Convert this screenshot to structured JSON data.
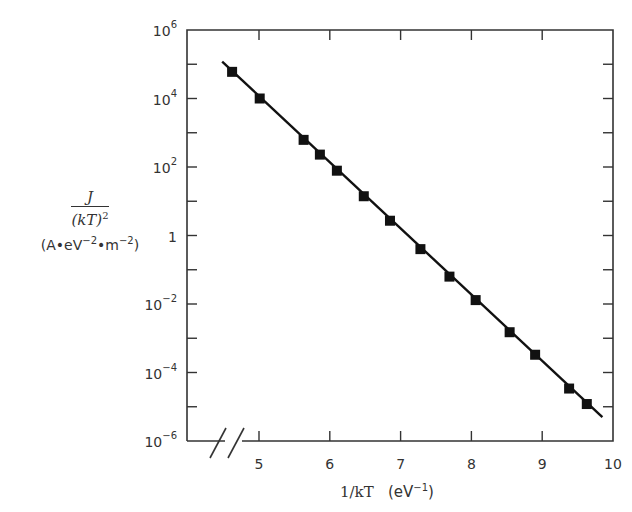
{
  "chart_data": {
    "type": "scatter",
    "title": "",
    "xlabel": "1/kT (eV^-1)",
    "ylabel": "J/(kT)^2 (A·eV^-2·m^-2)",
    "x_scale": "linear",
    "y_scale": "log",
    "xlim": [
      4.0,
      10
    ],
    "ylim": [
      1e-06,
      1000000.0
    ],
    "x_axis_break": true,
    "x_ticks": [
      5,
      6,
      7,
      8,
      9,
      10
    ],
    "y_ticks": [
      "10^6",
      "10^4",
      "10^2",
      "1",
      "10^-2",
      "10^-4",
      "10^-6"
    ],
    "grid": false,
    "legend": null,
    "series": [
      {
        "name": "measured",
        "marker": "filled-square",
        "x": [
          4.62,
          5.01,
          5.63,
          5.86,
          6.1,
          6.48,
          6.85,
          7.28,
          7.69,
          8.06,
          8.54,
          8.9,
          9.38,
          9.63
        ],
        "y": [
          60000.0,
          10000.0,
          620.0,
          230.0,
          78.0,
          14.0,
          2.7,
          0.4,
          0.063,
          0.013,
          0.0015,
          0.00033,
          3.4e-05,
          1.2e-05
        ]
      },
      {
        "name": "linear fit",
        "style": "solid-line",
        "x": [
          4.48,
          9.85
        ],
        "y": [
          120000.0,
          5e-06
        ]
      }
    ]
  },
  "labels": {
    "y_numerator": "J",
    "y_denominator_base": "(kT)",
    "y_denominator_exp": "2",
    "y_units_a": "(A•eV",
    "y_units_exp1": "−2",
    "y_units_b": "•m",
    "y_units_exp2": "−2",
    "y_units_c": ")",
    "x_var": "1/kT",
    "x_units_a": "(eV",
    "x_units_exp": "−1",
    "x_units_b": ")"
  },
  "colors": {
    "axis": "#333333",
    "line": "#111111",
    "marker": "#111111",
    "text": "#333333"
  }
}
